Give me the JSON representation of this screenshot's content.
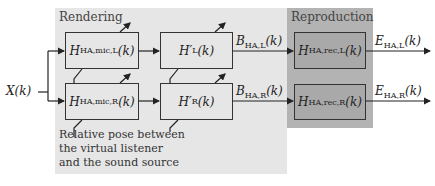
{
  "regions": {
    "rendering": {
      "label": "Rendering",
      "color": "#e6e6e6"
    },
    "reproduction": {
      "label": "Reproduction",
      "color": "#b3b3b3"
    }
  },
  "input": {
    "label": "X(k)"
  },
  "blocks": {
    "mic_L": {
      "symbol": "H",
      "sub": "HA,mic,L",
      "arg": "(k)"
    },
    "mic_R": {
      "symbol": "H",
      "sub": "HA,mic,R",
      "arg": "(k)"
    },
    "hp_L": {
      "symbol": "H′",
      "sub": "L",
      "arg": "(k)"
    },
    "hp_R": {
      "symbol": "H′",
      "sub": "R",
      "arg": "(k)"
    },
    "rec_L": {
      "symbol": "H",
      "sub": "HA,rec,L",
      "arg": "(k)"
    },
    "rec_R": {
      "symbol": "H",
      "sub": "HA,rec,R",
      "arg": "(k)"
    }
  },
  "signals": {
    "B_L": {
      "symbol": "B",
      "sub": "HA,L",
      "arg": "(k)"
    },
    "B_R": {
      "symbol": "B",
      "sub": "HA,R",
      "arg": "(k)"
    },
    "E_L": {
      "symbol": "E",
      "sub": "HA,L",
      "arg": "(k)"
    },
    "E_R": {
      "symbol": "E",
      "sub": "HA,R",
      "arg": "(k)"
    }
  },
  "note": {
    "lines": [
      "Relative pose between",
      "the virtual listener",
      "and the sound source"
    ]
  }
}
